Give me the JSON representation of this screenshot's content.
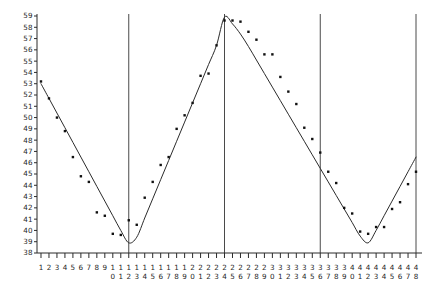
{
  "chart_data": {
    "type": "scatter",
    "title": "",
    "subtitle": "",
    "xlabel": "",
    "ylabel": "",
    "xlim": [
      0.5,
      48.5
    ],
    "ylim": [
      38,
      59
    ],
    "grid": false,
    "legend": "none",
    "y_ticks": [
      38,
      39,
      40,
      41,
      42,
      43,
      44,
      45,
      46,
      47,
      48,
      49,
      50,
      51,
      52,
      53,
      54,
      55,
      56,
      57,
      58,
      59
    ],
    "x_ticks": [
      1,
      2,
      3,
      4,
      5,
      6,
      7,
      8,
      9,
      10,
      11,
      12,
      13,
      14,
      15,
      16,
      17,
      18,
      19,
      20,
      21,
      22,
      23,
      24,
      25,
      26,
      27,
      28,
      29,
      30,
      31,
      32,
      33,
      34,
      35,
      36,
      37,
      38,
      39,
      40,
      41,
      42,
      43,
      44,
      45,
      46,
      47,
      48
    ],
    "x": [
      1,
      2,
      3,
      4,
      5,
      6,
      7,
      8,
      9,
      10,
      11,
      12,
      13,
      14,
      15,
      16,
      17,
      18,
      19,
      20,
      21,
      22,
      23,
      24,
      25,
      26,
      27,
      28,
      29,
      30,
      31,
      32,
      33,
      34,
      35,
      36,
      37,
      38,
      39,
      40,
      41,
      42,
      43,
      44,
      45,
      46,
      47,
      48
    ],
    "values": [
      53.2,
      51.7,
      50.0,
      48.8,
      46.5,
      44.8,
      44.3,
      41.6,
      41.3,
      39.7,
      39.6,
      40.9,
      40.5,
      42.9,
      44.3,
      45.8,
      46.5,
      49.0,
      50.2,
      51.3,
      53.7,
      53.9,
      56.4,
      58.6,
      58.6,
      58.5,
      57.6,
      56.9,
      55.6,
      55.6,
      53.6,
      52.3,
      51.2,
      49.1,
      48.1,
      46.9,
      45.2,
      44.2,
      42.0,
      41.5,
      39.9,
      39.7,
      40.3,
      40.3,
      41.9,
      42.5,
      44.1,
      45.2
    ],
    "series": [
      {
        "name": "observed",
        "marker": "square",
        "color": "#111111",
        "values": [
          53.2,
          51.7,
          50.0,
          48.8,
          46.5,
          44.8,
          44.3,
          41.6,
          41.3,
          39.7,
          39.6,
          40.9,
          40.5,
          42.9,
          44.3,
          45.8,
          46.5,
          49.0,
          50.2,
          51.3,
          53.7,
          53.9,
          56.4,
          58.6,
          58.6,
          58.5,
          57.6,
          56.9,
          55.6,
          55.6,
          53.6,
          52.3,
          51.2,
          49.1,
          48.1,
          46.9,
          45.2,
          44.2,
          42.0,
          41.5,
          39.9,
          39.7,
          40.3,
          40.3,
          41.9,
          42.5,
          44.1,
          45.2
        ]
      },
      {
        "name": "fitted-curve",
        "marker": "none",
        "color": "#2b2b2b",
        "values": [
          53.0,
          51.7,
          50.4,
          49.1,
          47.8,
          46.5,
          45.2,
          43.9,
          42.6,
          41.3,
          40.0,
          38.9,
          39.4,
          41.1,
          42.8,
          44.5,
          46.2,
          47.9,
          49.6,
          51.3,
          53.0,
          54.7,
          56.4,
          58.9,
          58.3,
          57.4,
          56.3,
          55.1,
          53.9,
          52.7,
          51.5,
          50.3,
          49.1,
          47.9,
          46.7,
          45.5,
          44.3,
          43.1,
          41.9,
          40.7,
          39.5,
          38.9,
          40.0,
          41.3,
          42.6,
          43.9,
          45.2,
          46.5
        ]
      }
    ],
    "reference_lines": {
      "orientation": "vertical",
      "x_positions": [
        12,
        24,
        36,
        48
      ]
    }
  },
  "axes": {
    "y_tick_labels": [
      "59",
      "58",
      "57",
      "56",
      "55",
      "54",
      "53",
      "52",
      "51",
      "50",
      "49",
      "48",
      "47",
      "46",
      "45",
      "44",
      "43",
      "42",
      "41",
      "40",
      "39",
      "38"
    ],
    "x_tick_labels_top": [
      "1",
      "2",
      "3",
      "4",
      "5",
      "6",
      "7",
      "8",
      "9",
      "1",
      "1",
      "1",
      "1",
      "1",
      "1",
      "1",
      "1",
      "1",
      "1",
      "2",
      "2",
      "2",
      "2",
      "2",
      "2",
      "2",
      "2",
      "2",
      "2",
      "3",
      "3",
      "3",
      "3",
      "3",
      "3",
      "3",
      "3",
      "3",
      "3",
      "4",
      "4",
      "4",
      "4",
      "4",
      "4",
      "4",
      "4",
      "4"
    ],
    "x_tick_labels_bottom": [
      "",
      "",
      "",
      "",
      "",
      "",
      "",
      "",
      "",
      "0",
      "1",
      "2",
      "3",
      "4",
      "5",
      "6",
      "7",
      "8",
      "9",
      "0",
      "1",
      "2",
      "3",
      "4",
      "5",
      "6",
      "7",
      "8",
      "9",
      "0",
      "1",
      "2",
      "3",
      "4",
      "5",
      "6",
      "7",
      "8",
      "9",
      "0",
      "1",
      "2",
      "3",
      "4",
      "5",
      "6",
      "7",
      "8"
    ]
  }
}
